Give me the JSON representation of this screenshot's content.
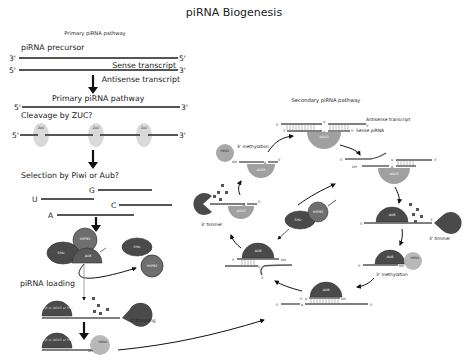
{
  "title": "piRNA Biogenesis",
  "primary": {
    "heading": "Primary piRNA pathway",
    "precursor_label": "piRNA precursor",
    "sense_label": "Sense transcript",
    "antisense_label": "Antisense transcript",
    "pathway_label": "Primary piRNA pathway",
    "cleavage_label": "Cleavage by ZUC?",
    "zuc_label": "ZUC",
    "selection_label": "Selection by Piwi or Aub?",
    "bases": [
      "G",
      "U",
      "C",
      "A"
    ],
    "loading_label": "piRNA loading",
    "trimming_label": "3' trimming",
    "proteins": {
      "shu": "SHU",
      "hsp83": "HSP83",
      "aub": "AUB",
      "piwi_complex": "AUB or AGO3 or Piwi",
      "hen1": "HEN1"
    }
  },
  "secondary": {
    "heading": "Secondary piRNA pathway",
    "antisense_label": "Antisense transcript",
    "sense_pirna_label": "Sense piRNA",
    "methylation_label": "3' methylation",
    "trimmer_label": "3' timmer",
    "proteins": {
      "ago3": "AGO3",
      "aub": "AUB",
      "hen1": "HEN1",
      "shu": "SHU",
      "hsp83": "HSP83"
    },
    "oh": "OH",
    "u": "U",
    "a": "A"
  },
  "ends": {
    "five": "5'",
    "three": "3'"
  },
  "colors": {
    "strand": "#555555",
    "dark_protein": "#4a4a4a",
    "mid_protein": "#6e6e6e",
    "light_protein": "#a8a8a8",
    "zuc": "#d9d9d9",
    "ago3": "#9a9a9a"
  }
}
